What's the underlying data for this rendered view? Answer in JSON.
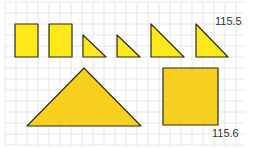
{
  "figure": {
    "background": "#ffffff",
    "grid_color": "#e6e6e6",
    "grid_spacing": 11,
    "outline_color": "#2b2b1a",
    "fill_light": "#ffe81a",
    "fill_dark": "#f7cf1e"
  },
  "labels": {
    "top_right": "115.5",
    "bottom_right": "115.6"
  },
  "shapes": [
    {
      "name": "small-rectangle-1",
      "type": "rect",
      "points": "15,24 38,24 38,57 15,57",
      "fill": "light"
    },
    {
      "name": "small-rectangle-2",
      "type": "rect",
      "points": "49,24 72,24 72,57 49,57",
      "fill": "light"
    },
    {
      "name": "small-triangle-1",
      "type": "triangle",
      "points": "83,35 83,57 106,57",
      "fill": "light"
    },
    {
      "name": "small-triangle-2",
      "type": "triangle",
      "points": "117,35 117,57 140,57",
      "fill": "light"
    },
    {
      "name": "medium-triangle-1",
      "type": "triangle",
      "points": "151,24 151,57 184,57",
      "fill": "light"
    },
    {
      "name": "medium-triangle-2",
      "type": "triangle",
      "points": "196,24 196,57 228,57",
      "fill": "light"
    },
    {
      "name": "large-triangle",
      "type": "triangle",
      "points": "84,68 27,126 141,126",
      "fill": "dark"
    },
    {
      "name": "large-square",
      "type": "rect",
      "points": "163,68 218,68 218,125 163,125",
      "fill": "dark"
    }
  ]
}
